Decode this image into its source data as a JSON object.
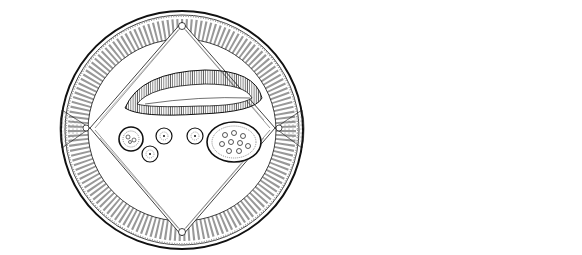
{
  "figure": {
    "panel_a": {
      "label": "A",
      "description": "Cross section of a nematode (female)",
      "labels": {
        "cuticle": "cuticle",
        "epidermis": "epidermis",
        "muscles": "muscles",
        "excretory_canal_1": "excretory",
        "excretory_canal_2": "canal",
        "lateral_line_1": "lateral",
        "lateral_line_2": "line",
        "oviduct": "oviduct",
        "ovary": "ovary",
        "uterus": "uterus",
        "dorsal_nerve_cord_1": "dorsal",
        "dorsal_nerve_cord_2": "nerve cord",
        "ventral_nerve_cord_1": "ventral",
        "ventral_nerve_cord_2": "nerve cord",
        "pseudocoel": "pseudocoel",
        "intestine": "intestine"
      }
    },
    "panel_b": {
      "label": "B",
      "description": "Single muscle cell",
      "labels": {
        "process_1": "process to",
        "process_2": "nerve cord",
        "cell_body_1": "cell",
        "cell_body_2": "body",
        "contractile_fibers": "contractile fibers"
      }
    },
    "colors": {
      "ink": "#111111",
      "background": "#ffffff",
      "stipple": "#bbbbbb"
    }
  }
}
